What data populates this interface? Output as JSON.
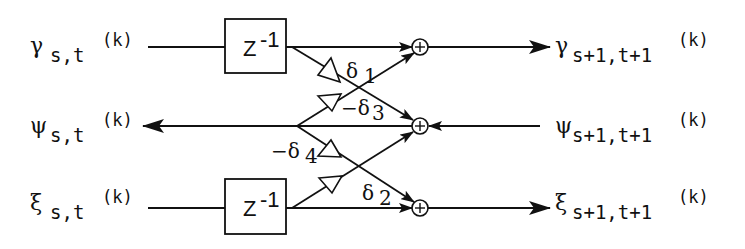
{
  "diagram": {
    "title": "",
    "inputs": [
      {
        "symbol": "γ",
        "sub": "s,t",
        "sup": "(k)",
        "row": "top"
      },
      {
        "symbol": "ψ",
        "sub": "s,t",
        "sup": "(k)",
        "row": "middle"
      },
      {
        "symbol": "ξ",
        "sub": "s,t",
        "sup": "(k)",
        "row": "bottom"
      }
    ],
    "outputs": [
      {
        "symbol": "γ",
        "sub": "s+1,t+1",
        "sup": "(k)",
        "row": "top"
      },
      {
        "symbol": "ψ",
        "sub": "s+1,t+1",
        "sup": "(k)",
        "row": "middle"
      },
      {
        "symbol": "ξ",
        "sub": "s+1,t+1",
        "sup": "(k)",
        "row": "bottom"
      }
    ],
    "delays": [
      {
        "label": "Z",
        "exp": "-1",
        "row": "top"
      },
      {
        "label": "Z",
        "exp": "-1",
        "row": "bottom"
      }
    ],
    "gains": [
      {
        "label": "δ",
        "sub": "1",
        "sign": ""
      },
      {
        "label": "δ",
        "sub": "3",
        "sign": "−"
      },
      {
        "label": "δ",
        "sub": "4",
        "sign": "−"
      },
      {
        "label": "δ",
        "sub": "2",
        "sign": ""
      }
    ],
    "adders": [
      {
        "symbol": "+",
        "row": "top"
      },
      {
        "symbol": "+",
        "row": "middle"
      },
      {
        "symbol": "+",
        "row": "bottom"
      }
    ]
  }
}
